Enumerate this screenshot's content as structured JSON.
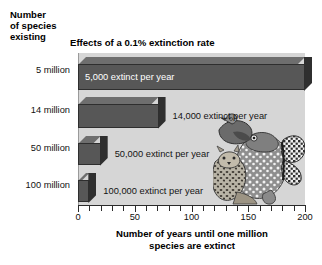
{
  "corner_heading": {
    "line1": "Number",
    "line2": "of species",
    "line3": "existing"
  },
  "chart_data": {
    "type": "bar",
    "orientation": "horizontal",
    "title": "Effects of a 0.1% extinction rate",
    "xlabel_line1": "Number of years until one million",
    "xlabel_line2": "species are extinct",
    "ylabel": "Number of species existing",
    "categories": [
      "5 million",
      "14 million",
      "50 million",
      "100 million"
    ],
    "values": [
      200,
      71,
      20,
      10
    ],
    "data_labels": [
      "5,000 extinct per year",
      "14,000 extinct per year",
      "50,000 extinct per year",
      "100,000 extinct per year"
    ],
    "label_placement": [
      "inside",
      "outside",
      "outside",
      "outside"
    ],
    "xlim": [
      0,
      200
    ],
    "xticks": [
      0,
      10,
      20,
      30,
      40,
      50,
      60,
      70,
      80,
      90,
      100,
      110,
      120,
      130,
      140,
      150,
      160,
      170,
      180,
      190,
      200
    ],
    "xtick_labels": [
      "0",
      "50",
      "100",
      "150",
      "200"
    ],
    "xtick_label_values": [
      0,
      50,
      100,
      150,
      200
    ],
    "grid": false,
    "legend": null,
    "colors": {
      "bar_front": "#575757",
      "bar_top": "#6e6e6e",
      "bar_side": "#2f2f2f",
      "plot_background": "#d6d6d6",
      "page_background": "#ffffff",
      "text": "#111111",
      "inside_label_text": "#ffffff"
    },
    "annotations": [
      "illustration of endangered species: bird, frog, butterfly, spotted wild cat"
    ]
  },
  "illustration": {
    "name": "endangered-species-illustration",
    "parts": [
      "bird",
      "frog",
      "butterfly",
      "leopard"
    ]
  }
}
